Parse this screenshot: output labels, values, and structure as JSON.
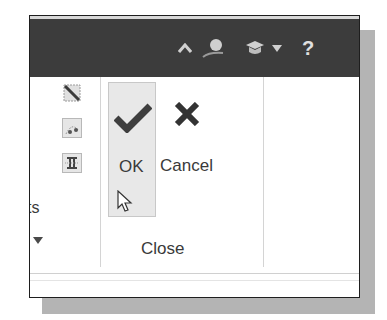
{
  "titlebar": {
    "icons": [
      "collapse-ribbon-icon",
      "user-account-icon",
      "learning-hat-icon",
      "dropdown-arrow-icon",
      "help-icon"
    ],
    "help_label": "?"
  },
  "ribbon": {
    "left_group": {
      "partial_label": "ts",
      "tools": [
        "hatch-tool-icon",
        "spline-points-tool-icon",
        "bridge-tool-icon"
      ],
      "expand_icon": "dropdown-arrow-icon"
    },
    "close_panel": {
      "ok_label": "OK",
      "cancel_label": "Cancel",
      "panel_title": "Close"
    }
  },
  "colors": {
    "titlebar_bg": "#3c3c3c",
    "ok_hover_bg": "#e8e8e8",
    "icon_dark": "#3a3a3a"
  }
}
